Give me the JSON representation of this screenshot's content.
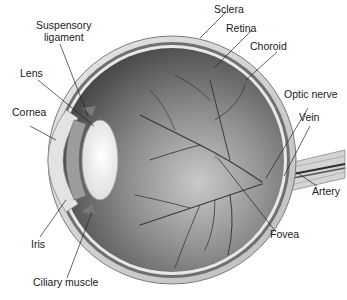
{
  "diagram": {
    "labels": {
      "suspensory_ligament_line1": "Suspensory",
      "suspensory_ligament_line2": "ligament",
      "lens": "Lens",
      "cornea": "Cornea",
      "iris": "Iris",
      "ciliary_muscle": "Ciliary muscle",
      "sclera": "Sclera",
      "retina": "Retina",
      "choroid": "Choroid",
      "optic_nerve": "Optic nerve",
      "vein": "Vein",
      "artery": "Artery",
      "fovea": "Fovea"
    },
    "colors": {
      "background": "#ffffff",
      "interior_dark": "#5a5a5a",
      "interior_light": "#c8c8c8",
      "sclera": "#d9d9d9",
      "lens": "#f4f4f4",
      "vessels": "#3a3a3a",
      "leader_lines": "#222222"
    }
  }
}
